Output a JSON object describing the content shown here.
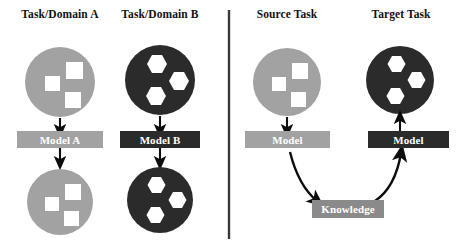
{
  "figure": {
    "type": "concept-diagram",
    "title_text": null,
    "panels": [
      {
        "id": "traditional-learning",
        "side": "left",
        "columns": [
          {
            "id": "task-domain-a",
            "heading": "Task/Domain A",
            "theme": "light",
            "dataset_shape": "squares",
            "model_label": "Model A",
            "flow": [
              "dataset",
              "arrow-down",
              "model",
              "arrow-down",
              "result"
            ]
          },
          {
            "id": "task-domain-b",
            "heading": "Task/Domain B",
            "theme": "dark",
            "dataset_shape": "hexagons",
            "model_label": "Model B",
            "flow": [
              "dataset",
              "arrow-down",
              "model",
              "arrow-down",
              "result"
            ]
          }
        ]
      },
      {
        "id": "transfer-learning",
        "side": "right",
        "columns": [
          {
            "id": "source-task",
            "heading": "Source Task",
            "theme": "light",
            "dataset_shape": "squares",
            "model_label": "Model",
            "flow": [
              "dataset",
              "arrow-down",
              "model",
              "curve-to-knowledge"
            ]
          },
          {
            "id": "target-task",
            "heading": "Target Task",
            "theme": "dark",
            "dataset_shape": "hexagons",
            "model_label": "Model",
            "flow": [
              "curve-from-knowledge",
              "model",
              "arrow-up",
              "dataset"
            ]
          }
        ],
        "knowledge_label": "Knowledge"
      }
    ]
  },
  "colors": {
    "light_gray": "#a2a2a2",
    "dark": "#2b2b2b",
    "mid_gray": "#8a8a8a",
    "white": "#ffffff",
    "arrow": "#0d0d0d",
    "divider": "#3a3a3a",
    "background": "#ffffff",
    "text_dark": "#111111",
    "text_light": "#ffffff"
  },
  "icons": {
    "divider": "vertical-divider",
    "arrow_down": "arrow-down-icon",
    "arrow_up": "arrow-up-icon",
    "curved_arrow": "curved-arrow-icon",
    "square_cluster": "square-cluster-icon",
    "hexagon_cluster": "hexagon-cluster-icon"
  }
}
